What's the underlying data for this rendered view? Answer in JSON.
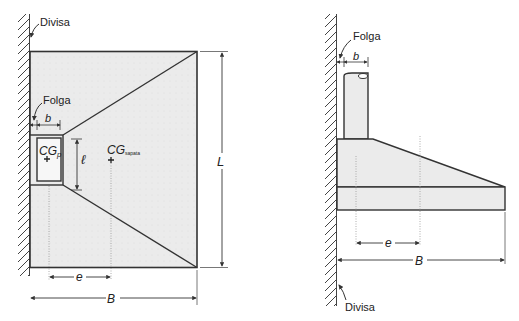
{
  "plan_view": {
    "wall_label": "Divisa",
    "gap_label": "Folga",
    "pillar_width": "b",
    "pillar_length": "ℓ",
    "cg_pillar_main": "CG",
    "cg_pillar_sub": "p",
    "cg_footing_main": "CG",
    "cg_footing_sub": "sapata",
    "eccentricity": "e",
    "footing_width": "B",
    "footing_length": "L"
  },
  "elevation_view": {
    "wall_label": "Divisa",
    "gap_label": "Folga",
    "pillar_width": "b",
    "eccentricity": "e",
    "footing_width": "B"
  },
  "colors": {
    "concrete_fill": "#ebebeb",
    "line": "#333333",
    "background": "#ffffff"
  }
}
